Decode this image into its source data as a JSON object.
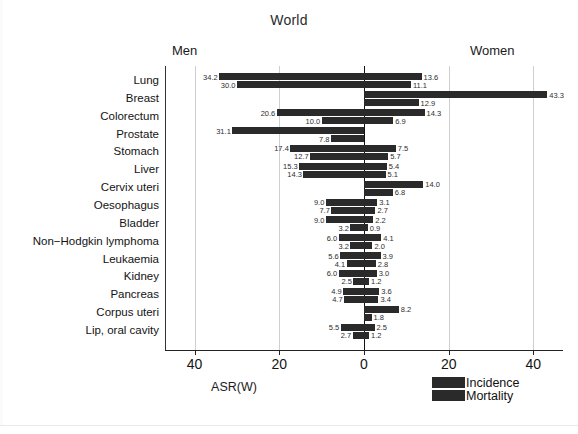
{
  "chart_data": {
    "type": "bar",
    "subtype": "diverging-population-pyramid",
    "title": "World",
    "xlabel": "ASR(W)",
    "ylabel": "",
    "left_header": "Men",
    "right_header": "Women",
    "xlim": [
      -47,
      47
    ],
    "xticks": [
      -40,
      -20,
      0,
      20,
      40
    ],
    "xticklabels": [
      "40",
      "20",
      "0",
      "20",
      "40"
    ],
    "grid": true,
    "grid_axis": "x",
    "legend": [
      "Incidence",
      "Mortality"
    ],
    "legend_position": "bottom-right",
    "bar_color": "#2a2a2a",
    "categories": [
      "Lung",
      "Breast",
      "Colorectum",
      "Prostate",
      "Stomach",
      "Liver",
      "Cervix uteri",
      "Oesophagus",
      "Bladder",
      "Non−Hodgkin lymphoma",
      "Leukaemia",
      "Kidney",
      "Pancreas",
      "Corpus uteri",
      "Lip, oral cavity"
    ],
    "series": [
      {
        "name": "Men Incidence",
        "side": "left",
        "measure": "Incidence",
        "values": [
          34.2,
          null,
          20.6,
          31.1,
          17.4,
          15.3,
          null,
          9.0,
          9.0,
          6.0,
          5.6,
          6.0,
          4.9,
          null,
          5.5
        ]
      },
      {
        "name": "Men Mortality",
        "side": "left",
        "measure": "Mortality",
        "values": [
          30.0,
          null,
          10.0,
          7.8,
          12.7,
          14.3,
          null,
          7.7,
          3.2,
          3.2,
          4.1,
          2.5,
          4.7,
          null,
          2.7
        ]
      },
      {
        "name": "Women Incidence",
        "side": "right",
        "measure": "Incidence",
        "values": [
          13.6,
          43.3,
          14.3,
          null,
          7.5,
          5.4,
          14.0,
          3.1,
          2.2,
          4.1,
          3.9,
          3.0,
          3.6,
          8.2,
          2.5
        ]
      },
      {
        "name": "Women Mortality",
        "side": "right",
        "measure": "Mortality",
        "values": [
          11.1,
          12.9,
          6.9,
          null,
          5.7,
          5.1,
          6.8,
          2.7,
          0.9,
          2.0,
          2.8,
          1.2,
          3.4,
          1.8,
          1.2
        ]
      }
    ],
    "rows": [
      {
        "category": "Lung",
        "men_incidence": 34.2,
        "men_mortality": 30.0,
        "women_incidence": 13.6,
        "women_mortality": 11.1
      },
      {
        "category": "Breast",
        "men_incidence": null,
        "men_mortality": null,
        "women_incidence": 43.3,
        "women_mortality": 12.9
      },
      {
        "category": "Colorectum",
        "men_incidence": 20.6,
        "men_mortality": 10.0,
        "women_incidence": 14.3,
        "women_mortality": 6.9
      },
      {
        "category": "Prostate",
        "men_incidence": 31.1,
        "men_mortality": 7.8,
        "women_incidence": null,
        "women_mortality": null
      },
      {
        "category": "Stomach",
        "men_incidence": 17.4,
        "men_mortality": 12.7,
        "women_incidence": 7.5,
        "women_mortality": 5.7
      },
      {
        "category": "Liver",
        "men_incidence": 15.3,
        "men_mortality": 14.3,
        "women_incidence": 5.4,
        "women_mortality": 5.1
      },
      {
        "category": "Cervix uteri",
        "men_incidence": null,
        "men_mortality": null,
        "women_incidence": 14.0,
        "women_mortality": 6.8
      },
      {
        "category": "Oesophagus",
        "men_incidence": 9.0,
        "men_mortality": 7.7,
        "women_incidence": 3.1,
        "women_mortality": 2.7
      },
      {
        "category": "Bladder",
        "men_incidence": 9.0,
        "men_mortality": 3.2,
        "women_incidence": 2.2,
        "women_mortality": 0.9
      },
      {
        "category": "Non−Hodgkin lymphoma",
        "men_incidence": 6.0,
        "men_mortality": 3.2,
        "women_incidence": 4.1,
        "women_mortality": 2.0
      },
      {
        "category": "Leukaemia",
        "men_incidence": 5.6,
        "men_mortality": 4.1,
        "women_incidence": 3.9,
        "women_mortality": 2.8
      },
      {
        "category": "Kidney",
        "men_incidence": 6.0,
        "men_mortality": 2.5,
        "women_incidence": 3.0,
        "women_mortality": 1.2
      },
      {
        "category": "Pancreas",
        "men_incidence": 4.9,
        "men_mortality": 4.7,
        "women_incidence": 3.6,
        "women_mortality": 3.4
      },
      {
        "category": "Corpus uteri",
        "men_incidence": null,
        "men_mortality": null,
        "women_incidence": 8.2,
        "women_mortality": 1.8
      },
      {
        "category": "Lip, oral cavity",
        "men_incidence": 5.5,
        "men_mortality": 2.7,
        "women_incidence": 2.5,
        "women_mortality": 1.2
      }
    ]
  }
}
